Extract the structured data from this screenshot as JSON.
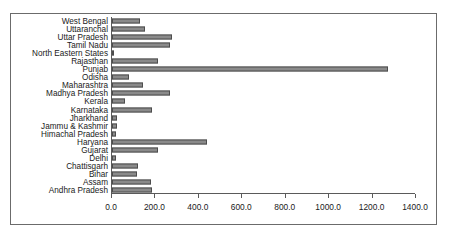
{
  "chart_data": {
    "type": "bar",
    "orientation": "horizontal",
    "title": "",
    "subtitle": "",
    "xlabel": "",
    "ylabel": "",
    "xlim": [
      0,
      1400
    ],
    "grid": false,
    "legend": null,
    "bar_color": "#8a8a8a",
    "bar_border_color": "#4d4d4d",
    "frame_color": "#6b6b6b",
    "axis_color": "#5a5a5a",
    "xticks": [
      0,
      200,
      400,
      600,
      800,
      1000,
      1200,
      1400
    ],
    "xtick_labels": [
      "0.0",
      "200.0",
      "400.0",
      "600.0",
      "800.0",
      "1000.0",
      "1200.0",
      "1400.0"
    ],
    "categories": [
      "West Bengal",
      "Uttaranchal",
      "Uttar Pradesh",
      "Tamil Nadu",
      "North Eastern States",
      "Rajasthan",
      "Punjab",
      "Odisha",
      "Maharashtra",
      "Madhya Pradesh",
      "Kerala",
      "Karnataka",
      "Jharkhand",
      "Jammu & Kashmir",
      "Himachal Pradesh",
      "Haryana",
      "Gujarat",
      "Delhi",
      "Chattisgarh",
      "Bihar",
      "Assam",
      "Andhra Pradesh"
    ],
    "values": [
      130,
      152,
      276,
      266,
      8,
      212,
      1272,
      76,
      145,
      266,
      58,
      184,
      22,
      22,
      18,
      437,
      212,
      17,
      121,
      113,
      179,
      183
    ]
  }
}
